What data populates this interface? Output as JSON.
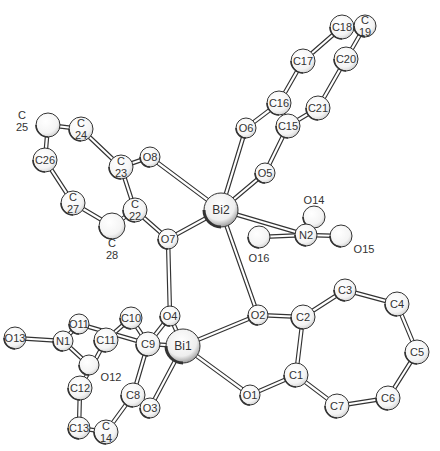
{
  "diagram": {
    "type": "ORTEP molecular structure",
    "atoms": [
      {
        "id": "C18",
        "label": "C18",
        "x": 342,
        "y": 27,
        "r": 12,
        "label_pos": "center"
      },
      {
        "id": "C19",
        "label": "C\n19",
        "x": 365,
        "y": 26,
        "r": 11,
        "label_pos": "center"
      },
      {
        "id": "C17",
        "label": "C17",
        "x": 303,
        "y": 61,
        "r": 12,
        "label_pos": "center"
      },
      {
        "id": "C20",
        "label": "C20",
        "x": 346,
        "y": 59,
        "r": 12,
        "label_pos": "center"
      },
      {
        "id": "C16",
        "label": "C16",
        "x": 279,
        "y": 103,
        "r": 12,
        "label_pos": "center"
      },
      {
        "id": "C21",
        "label": "C21",
        "x": 318,
        "y": 108,
        "r": 12,
        "label_pos": "center"
      },
      {
        "id": "C15",
        "label": "C15",
        "x": 288,
        "y": 126,
        "r": 12,
        "label_pos": "center"
      },
      {
        "id": "O6",
        "label": "O6",
        "x": 246,
        "y": 128,
        "r": 10,
        "label_pos": "center"
      },
      {
        "id": "O5",
        "label": "O5",
        "x": 265,
        "y": 173,
        "r": 10,
        "label_pos": "center"
      },
      {
        "id": "Bi2",
        "label": "Bi2",
        "x": 221,
        "y": 210,
        "r": 17,
        "label_pos": "center"
      },
      {
        "id": "C25",
        "label": "C\n25",
        "x": 48,
        "y": 125,
        "r": 12,
        "label_pos": "left"
      },
      {
        "id": "C24",
        "label": "C\n24",
        "x": 81,
        "y": 129,
        "r": 12,
        "label_pos": "center"
      },
      {
        "id": "C26",
        "label": "C26",
        "x": 45,
        "y": 160,
        "r": 12,
        "label_pos": "center"
      },
      {
        "id": "C23",
        "label": "C\n23",
        "x": 121,
        "y": 167,
        "r": 12,
        "label_pos": "center"
      },
      {
        "id": "O8",
        "label": "O8",
        "x": 150,
        "y": 157,
        "r": 10,
        "label_pos": "center"
      },
      {
        "id": "C27",
        "label": "C\n27",
        "x": 73,
        "y": 203,
        "r": 12,
        "label_pos": "center"
      },
      {
        "id": "C22",
        "label": "C\n22",
        "x": 135,
        "y": 210,
        "r": 12,
        "label_pos": "center"
      },
      {
        "id": "C28",
        "label": "C\n28",
        "x": 112,
        "y": 226,
        "r": 13,
        "label_pos": "below"
      },
      {
        "id": "O7",
        "label": "O7",
        "x": 168,
        "y": 239,
        "r": 10,
        "label_pos": "center"
      },
      {
        "id": "O14",
        "label": "O14",
        "x": 314,
        "y": 217,
        "r": 11,
        "label_pos": "above"
      },
      {
        "id": "N2",
        "label": "N2",
        "x": 306,
        "y": 235,
        "r": 11,
        "label_pos": "center"
      },
      {
        "id": "O15",
        "label": "O15",
        "x": 341,
        "y": 236,
        "r": 11,
        "label_pos": "below-right"
      },
      {
        "id": "O16",
        "label": "O16",
        "x": 259,
        "y": 237,
        "r": 11,
        "label_pos": "below"
      },
      {
        "id": "O2",
        "label": "O2",
        "x": 258,
        "y": 315,
        "r": 10,
        "label_pos": "center"
      },
      {
        "id": "C3",
        "label": "C3",
        "x": 345,
        "y": 290,
        "r": 11,
        "label_pos": "center"
      },
      {
        "id": "C2",
        "label": "C2",
        "x": 303,
        "y": 317,
        "r": 12,
        "label_pos": "center"
      },
      {
        "id": "C4",
        "label": "C4",
        "x": 397,
        "y": 304,
        "r": 12,
        "label_pos": "center"
      },
      {
        "id": "C5",
        "label": "C5",
        "x": 417,
        "y": 352,
        "r": 12,
        "label_pos": "center"
      },
      {
        "id": "C1",
        "label": "C1",
        "x": 296,
        "y": 375,
        "r": 12,
        "label_pos": "center"
      },
      {
        "id": "O1",
        "label": "O1",
        "x": 250,
        "y": 395,
        "r": 10,
        "label_pos": "center"
      },
      {
        "id": "C7",
        "label": "C7",
        "x": 337,
        "y": 406,
        "r": 12,
        "label_pos": "center"
      },
      {
        "id": "C6",
        "label": "C6",
        "x": 388,
        "y": 398,
        "r": 12,
        "label_pos": "center"
      },
      {
        "id": "O4",
        "label": "O4",
        "x": 170,
        "y": 316,
        "r": 10,
        "label_pos": "center"
      },
      {
        "id": "C10",
        "label": "C10",
        "x": 131,
        "y": 318,
        "r": 11,
        "label_pos": "center"
      },
      {
        "id": "O11",
        "label": "O11",
        "x": 79,
        "y": 324,
        "r": 10,
        "label_pos": "center"
      },
      {
        "id": "O13",
        "label": "O13",
        "x": 15,
        "y": 338,
        "r": 11,
        "label_pos": "center"
      },
      {
        "id": "N1",
        "label": "N1",
        "x": 63,
        "y": 341,
        "r": 10,
        "label_pos": "center"
      },
      {
        "id": "C11",
        "label": "C11",
        "x": 106,
        "y": 340,
        "r": 12,
        "label_pos": "center"
      },
      {
        "id": "C9",
        "label": "C9",
        "x": 148,
        "y": 344,
        "r": 12,
        "label_pos": "center"
      },
      {
        "id": "Bi1",
        "label": "Bi1",
        "x": 183,
        "y": 346,
        "r": 17,
        "label_pos": "center"
      },
      {
        "id": "O12",
        "label": "O12",
        "x": 89,
        "y": 365,
        "r": 10,
        "label_pos": "below-right"
      },
      {
        "id": "C12",
        "label": "C12",
        "x": 80,
        "y": 388,
        "r": 12,
        "label_pos": "center"
      },
      {
        "id": "C8",
        "label": "C8",
        "x": 133,
        "y": 395,
        "r": 12,
        "label_pos": "center"
      },
      {
        "id": "O3",
        "label": "O3",
        "x": 150,
        "y": 408,
        "r": 10,
        "label_pos": "center"
      },
      {
        "id": "C13",
        "label": "C13",
        "x": 79,
        "y": 428,
        "r": 11,
        "label_pos": "center"
      },
      {
        "id": "C14",
        "label": "C\n14",
        "x": 106,
        "y": 432,
        "r": 12,
        "label_pos": "center"
      }
    ],
    "bonds": [
      [
        "C18",
        "C19"
      ],
      [
        "C18",
        "C17"
      ],
      [
        "C19",
        "C20"
      ],
      [
        "C17",
        "C16"
      ],
      [
        "C20",
        "C21"
      ],
      [
        "C16",
        "C15"
      ],
      [
        "C21",
        "C15"
      ],
      [
        "C16",
        "O6"
      ],
      [
        "C15",
        "O5"
      ],
      [
        "O6",
        "Bi2"
      ],
      [
        "O5",
        "Bi2"
      ],
      [
        "C25",
        "C24"
      ],
      [
        "C25",
        "C26"
      ],
      [
        "C24",
        "C23"
      ],
      [
        "C26",
        "C27"
      ],
      [
        "C23",
        "C22"
      ],
      [
        "C27",
        "C28"
      ],
      [
        "C28",
        "C22"
      ],
      [
        "C23",
        "O8"
      ],
      [
        "O8",
        "Bi2"
      ],
      [
        "C22",
        "O7"
      ],
      [
        "O7",
        "Bi2"
      ],
      [
        "Bi2",
        "N2"
      ],
      [
        "Bi2",
        "O2"
      ],
      [
        "O14",
        "N2"
      ],
      [
        "N2",
        "O15"
      ],
      [
        "N2",
        "O16"
      ],
      [
        "O2",
        "C2"
      ],
      [
        "C2",
        "C3"
      ],
      [
        "C3",
        "C4"
      ],
      [
        "C4",
        "C5"
      ],
      [
        "C5",
        "C6"
      ],
      [
        "C6",
        "C7"
      ],
      [
        "C7",
        "C1"
      ],
      [
        "C1",
        "C2"
      ],
      [
        "C1",
        "O1"
      ],
      [
        "O2",
        "Bi1"
      ],
      [
        "O1",
        "Bi1"
      ],
      [
        "O7",
        "O4"
      ],
      [
        "O4",
        "Bi1"
      ],
      [
        "O4",
        "C9"
      ],
      [
        "O13",
        "N1"
      ],
      [
        "N1",
        "O11"
      ],
      [
        "N1",
        "O12"
      ],
      [
        "O11",
        "C9"
      ],
      [
        "C10",
        "C11"
      ],
      [
        "C10",
        "C9"
      ],
      [
        "C11",
        "C12"
      ],
      [
        "C9",
        "C8"
      ],
      [
        "C12",
        "C13"
      ],
      [
        "C13",
        "C14"
      ],
      [
        "C14",
        "C8"
      ],
      [
        "C8",
        "O3"
      ],
      [
        "O3",
        "Bi1"
      ],
      [
        "C9",
        "Bi1"
      ]
    ]
  }
}
